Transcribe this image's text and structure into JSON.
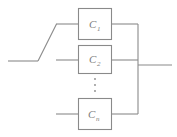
{
  "diagram": {
    "type": "reliability-block-diagram",
    "background_color": "#ffffff",
    "line_color": "#8a8a8a",
    "text_color": "#7d7d7d",
    "blocks": [
      {
        "id": "block-1",
        "label_base": "C",
        "label_sub": "1",
        "x": 78,
        "y": 8,
        "width": 34,
        "height": 32
      },
      {
        "id": "block-2",
        "label_base": "C",
        "label_sub": "2",
        "x": 78,
        "y": 45,
        "width": 34,
        "height": 29
      },
      {
        "id": "block-n",
        "label_base": "C",
        "label_sub": "n",
        "x": 78,
        "y": 98,
        "width": 34,
        "height": 32
      }
    ],
    "ellipsis": {
      "name": "vertical-ellipsis",
      "dot_count": 3,
      "x": 95,
      "y_start": 79,
      "y_step": 6
    },
    "wires": [
      {
        "name": "input-wire-left",
        "points": "8,61 38,61"
      },
      {
        "name": "input-wire-diagonal",
        "points": "38,61 56,24"
      },
      {
        "name": "input-wire-to-block-1",
        "points": "56,24 78,24"
      },
      {
        "name": "input-wire-to-block-2",
        "points": "56,60 78,60"
      },
      {
        "name": "input-wire-to-block-n",
        "points": "56,114 78,114"
      },
      {
        "name": "output-wire-block-1",
        "points": "112,24 138,24"
      },
      {
        "name": "output-wire-block-2",
        "points": "112,60 138,60"
      },
      {
        "name": "output-wire-block-n",
        "points": "112,114 138,114"
      },
      {
        "name": "output-bus-vertical",
        "points": "138,24 138,114"
      },
      {
        "name": "output-wire-right",
        "points": "138,65 172,65"
      }
    ]
  }
}
